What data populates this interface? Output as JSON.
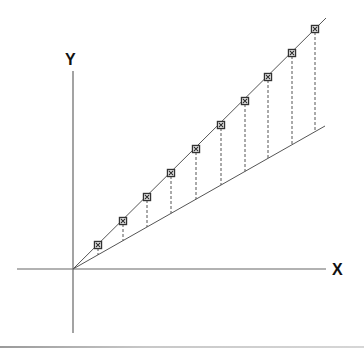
{
  "diagram": {
    "title": "",
    "axes": {
      "x_label": "X",
      "y_label": "Y",
      "origin_px": [
        73,
        269
      ],
      "x_axis_px": {
        "from": [
          17,
          269
        ],
        "to": [
          326,
          269
        ]
      },
      "y_axis_px": {
        "from": [
          73,
          71
        ],
        "to": [
          73,
          333
        ]
      }
    },
    "lines": [
      {
        "name": "upper-line",
        "from_px": [
          73,
          269
        ],
        "to_px": [
          326,
          18
        ],
        "style": "solid"
      },
      {
        "name": "lower-line",
        "from_px": [
          73,
          269
        ],
        "to_px": [
          325,
          126
        ],
        "style": "solid"
      }
    ],
    "markers": {
      "shape": "boxed-x",
      "points_px": [
        [
          98,
          245
        ],
        [
          123,
          221
        ],
        [
          147,
          197
        ],
        [
          171,
          173
        ],
        [
          196,
          149
        ],
        [
          221,
          125
        ],
        [
          245,
          101
        ],
        [
          268,
          77
        ],
        [
          292,
          53
        ],
        [
          315,
          29
        ]
      ]
    },
    "drop_lines": {
      "style": "dashed",
      "description": "vertical dashed lines from each upper-line marker down to the lower line"
    },
    "colors": {
      "line": "#555555",
      "axis": "#666666",
      "marker_fill": "#333333",
      "label": "#111111",
      "background": "#ffffff"
    }
  }
}
